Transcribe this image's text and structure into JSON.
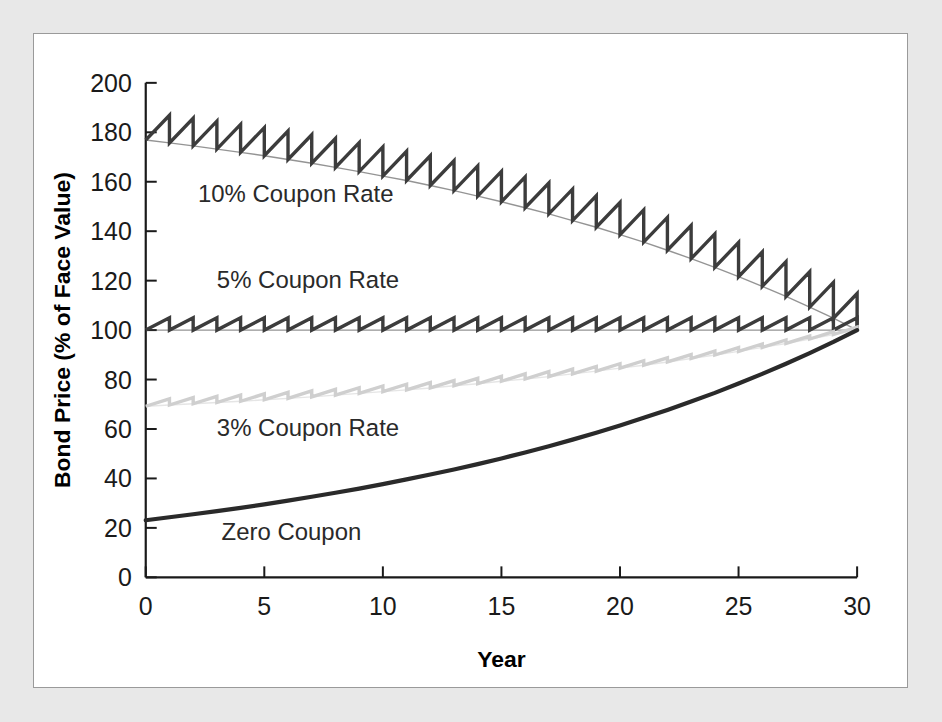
{
  "figure": {
    "background_color": "#e8e8e8",
    "panel_color": "#ffffff",
    "panel_border_color": "#9a9a9a"
  },
  "chart_data": {
    "type": "line",
    "title": "",
    "subtitle": "",
    "xlabel": "Year",
    "ylabel": "Bond Price (% of Face Value)",
    "xlim": [
      0,
      30
    ],
    "ylim": [
      0,
      200
    ],
    "xticks": [
      0,
      5,
      10,
      15,
      20,
      25,
      30
    ],
    "xtick_labels": [
      "0",
      "5",
      "10",
      "15",
      "20",
      "25",
      "30"
    ],
    "yticks": [
      0,
      20,
      40,
      60,
      80,
      100,
      120,
      140,
      160,
      180,
      200
    ],
    "ytick_labels": [
      "0",
      "20",
      "40",
      "60",
      "80",
      "100",
      "120",
      "140",
      "160",
      "180",
      "200"
    ],
    "grid": false,
    "legend_position": "inline-annotations",
    "annotations": [
      {
        "text": "10% Coupon Rate",
        "x": 2.2,
        "y": 152,
        "color": "#2a2a2a"
      },
      {
        "text": "5% Coupon Rate",
        "x": 3.0,
        "y": 117,
        "color": "#2a2a2a"
      },
      {
        "text": "3% Coupon Rate",
        "x": 3.0,
        "y": 57,
        "color": "#2a2a2a"
      },
      {
        "text": "Zero Coupon",
        "x": 3.2,
        "y": 15,
        "color": "#2a2a2a"
      }
    ],
    "market_yield_pct": 5,
    "maturity_years": 30,
    "coupon_frequency_per_year": 1,
    "series": [
      {
        "name": "10% Coupon Rate",
        "coupon_rate_pct": 10,
        "color": "#3c3c3c",
        "shape": "sawtooth",
        "envelope_note": "clean price declines from premium toward par; annual coupon causes sawtooth drops",
        "clean_price_by_year": [
          176.9,
          175.7,
          174.5,
          173.2,
          171.9,
          170.5,
          169.0,
          167.5,
          165.8,
          164.1,
          162.3,
          160.5,
          158.5,
          156.4,
          154.2,
          151.9,
          149.5,
          147.0,
          144.3,
          141.6,
          138.6,
          135.6,
          132.3,
          128.9,
          125.4,
          121.6,
          117.7,
          113.6,
          109.3,
          104.8,
          100.0
        ],
        "peak_price_by_year": [
          186.9,
          185.7,
          184.5,
          183.2,
          181.9,
          180.5,
          179.0,
          177.5,
          175.8,
          174.1,
          172.3,
          170.5,
          168.5,
          166.4,
          164.2,
          161.9,
          159.5,
          157.0,
          154.3,
          151.6,
          148.6,
          145.6,
          142.3,
          138.9,
          135.4,
          131.6,
          127.7,
          123.6,
          119.3,
          114.8
        ]
      },
      {
        "name": "5% Coupon Rate",
        "coupon_rate_pct": 5,
        "color": "#3c3c3c",
        "shape": "sawtooth",
        "envelope_note": "priced at par; clean price stays at 100 throughout",
        "clean_price_by_year": [
          100,
          100,
          100,
          100,
          100,
          100,
          100,
          100,
          100,
          100,
          100,
          100,
          100,
          100,
          100,
          100,
          100,
          100,
          100,
          100,
          100,
          100,
          100,
          100,
          100,
          100,
          100,
          100,
          100,
          100,
          100
        ],
        "peak_price_by_year": [
          105,
          105,
          105,
          105,
          105,
          105,
          105,
          105,
          105,
          105,
          105,
          105,
          105,
          105,
          105,
          105,
          105,
          105,
          105,
          105,
          105,
          105,
          105,
          105,
          105,
          105,
          105,
          105,
          105,
          105
        ]
      },
      {
        "name": "3% Coupon Rate",
        "coupon_rate_pct": 3,
        "color": "#cfcfcf",
        "shape": "sawtooth",
        "envelope_note": "discount bond; clean price accretes upward to par at maturity",
        "clean_price_by_year": [
          69.2,
          69.7,
          70.2,
          70.7,
          71.2,
          71.8,
          72.4,
          73.0,
          73.7,
          74.4,
          75.1,
          75.8,
          76.6,
          77.5,
          78.3,
          79.3,
          80.2,
          81.2,
          82.3,
          83.4,
          84.6,
          85.8,
          87.1,
          88.5,
          89.9,
          91.4,
          93.0,
          94.6,
          96.4,
          98.2,
          100.0
        ],
        "peak_price_by_year": [
          72.2,
          72.7,
          73.2,
          73.7,
          74.2,
          74.8,
          75.4,
          76.0,
          76.7,
          77.4,
          78.1,
          78.8,
          79.6,
          80.5,
          81.3,
          82.3,
          83.2,
          84.2,
          85.3,
          86.4,
          87.6,
          88.8,
          90.1,
          91.5,
          92.9,
          94.4,
          96.0,
          97.6,
          99.4,
          101.2
        ]
      },
      {
        "name": "Zero Coupon",
        "coupon_rate_pct": 0,
        "color": "#2a2a2a",
        "shape": "smooth",
        "envelope_note": "pure discount; price grows exponentially at the market yield to 100",
        "price_by_year": [
          23.1,
          24.3,
          25.5,
          26.8,
          28.1,
          29.5,
          31.0,
          32.6,
          34.2,
          35.9,
          37.7,
          39.6,
          41.6,
          43.6,
          45.8,
          48.1,
          50.5,
          53.0,
          55.7,
          58.5,
          61.4,
          64.5,
          67.7,
          71.1,
          74.6,
          78.4,
          82.3,
          86.4,
          90.7,
          95.2,
          100.0
        ]
      }
    ]
  }
}
